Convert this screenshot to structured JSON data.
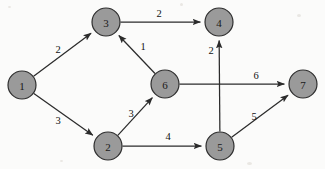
{
  "figure": {
    "background_color": "#fbfbfa",
    "node_fill_color": "#9a9a9a",
    "node_stroke_color": "#2e2e2e",
    "edge_color": "#2b2b2b",
    "label_color": "#121212"
  },
  "chart_data": {
    "type": "diagram",
    "title": "",
    "xlabel": "",
    "ylabel": "",
    "directed": true,
    "nodes": [
      {
        "id": "1",
        "label": "1",
        "x": 22,
        "y": 85,
        "r": 14
      },
      {
        "id": "2",
        "label": "2",
        "x": 108,
        "y": 146,
        "r": 14
      },
      {
        "id": "3",
        "label": "3",
        "x": 106,
        "y": 22,
        "r": 14
      },
      {
        "id": "4",
        "label": "4",
        "x": 219,
        "y": 22,
        "r": 14
      },
      {
        "id": "5",
        "label": "5",
        "x": 220,
        "y": 146,
        "r": 14
      },
      {
        "id": "6",
        "label": "6",
        "x": 165,
        "y": 84,
        "r": 14
      },
      {
        "id": "7",
        "label": "7",
        "x": 303,
        "y": 84,
        "r": 14
      }
    ],
    "edges": [
      {
        "from": "1",
        "to": "3",
        "weight": "2",
        "lx": 58,
        "ly": 49
      },
      {
        "from": "1",
        "to": "2",
        "weight": "3",
        "lx": 58,
        "ly": 120
      },
      {
        "from": "3",
        "to": "4",
        "weight": "2",
        "lx": 159,
        "ly": 13
      },
      {
        "from": "6",
        "to": "3",
        "weight": "1",
        "lx": 143,
        "ly": 46
      },
      {
        "from": "2",
        "to": "6",
        "weight": "3",
        "lx": 131,
        "ly": 113
      },
      {
        "from": "2",
        "to": "5",
        "weight": "4",
        "lx": 168,
        "ly": 136
      },
      {
        "from": "6",
        "to": "7",
        "weight": "6",
        "lx": 256,
        "ly": 75
      },
      {
        "from": "5",
        "to": "7",
        "weight": "5",
        "lx": 254,
        "ly": 116
      },
      {
        "from": "5",
        "to": "4",
        "weight": "2",
        "lx": 211,
        "ly": 50
      }
    ]
  }
}
